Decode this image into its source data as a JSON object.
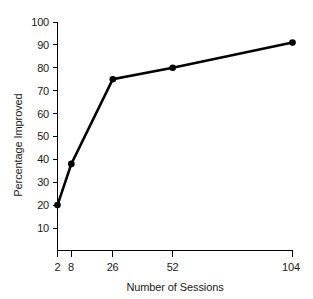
{
  "chart_data": {
    "type": "line",
    "title": "",
    "subtitle": "",
    "xlabel": "Number of Sessions",
    "ylabel": "Percentage Improved",
    "x": [
      2,
      8,
      26,
      52,
      104
    ],
    "values": [
      20,
      38,
      75,
      80,
      91
    ],
    "series": [
      {
        "name": "Percentage Improved",
        "x": [
          2,
          8,
          26,
          52,
          104
        ],
        "values": [
          20,
          38,
          75,
          80,
          91
        ],
        "color": "#000000",
        "marker": "filled-circle",
        "line_width": 2.6
      }
    ],
    "xlim": [
      0,
      108
    ],
    "ylim": [
      0,
      100
    ],
    "x_tick_labels": [
      "2",
      "8",
      "26",
      "52",
      "104"
    ],
    "x_tick_values": [
      2,
      8,
      26,
      52,
      104
    ],
    "y_tick_labels": [
      "10",
      "20",
      "30",
      "40",
      "50",
      "60",
      "70",
      "80",
      "90",
      "100"
    ],
    "y_tick_values": [
      10,
      20,
      30,
      40,
      50,
      60,
      70,
      80,
      90,
      100
    ],
    "x_scale": "linear",
    "y_scale": "linear",
    "grid": false,
    "legend": false,
    "legend_position": "none",
    "annotations": [],
    "background_color": "#ffffff",
    "axis_color": "#000000",
    "text_color": "#1a1a1a"
  },
  "axes": {
    "y_axis_title": "Percentage Improved",
    "x_axis_title": "Number of Sessions"
  }
}
